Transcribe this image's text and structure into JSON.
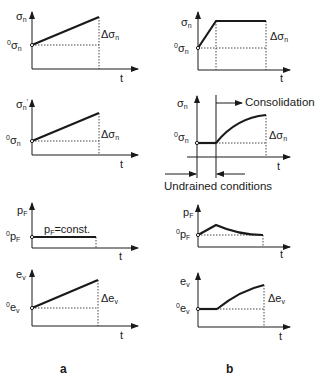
{
  "figure": {
    "columns": [
      {
        "id": "a",
        "label": "a"
      },
      {
        "id": "b",
        "label": "b"
      }
    ],
    "annotations": {
      "consolidation": "Consolidation",
      "undrained": "Undrained conditions",
      "pf_const": "p",
      "pf_const_sub": "F",
      "pf_const_rest": "=const."
    },
    "axis_t": "t",
    "panels": [
      {
        "row": "total-stress",
        "y_label": "σ",
        "y_sub": "n",
        "init_sup": "0",
        "init": "σ",
        "init_sub": "n",
        "delta": "Δσ",
        "delta_sub": "n"
      },
      {
        "row": "effective-stress",
        "y_label": "σ",
        "y_sub": "n",
        "y_sup": "'",
        "init_sup": "0",
        "init": "σ",
        "init_sub": "n",
        "delta": "Δσ",
        "delta_sub": "n"
      },
      {
        "row": "pore-pressure",
        "y_label": "p",
        "y_sub": "F",
        "init_sup": "0",
        "init": "p",
        "init_sub": "F"
      },
      {
        "row": "volumetric-strain",
        "y_label": "e",
        "y_sub": "v",
        "init_sup": "0",
        "init": "e",
        "init_sub": "v",
        "delta": "Δe",
        "delta_sub": "v"
      }
    ]
  }
}
